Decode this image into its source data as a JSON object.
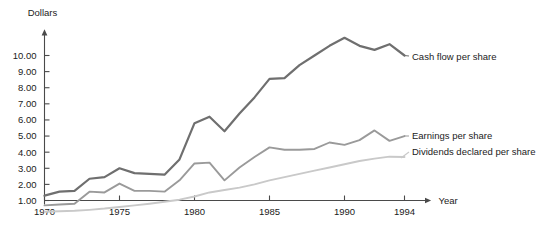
{
  "chart_data": {
    "type": "line",
    "title": "",
    "xlabel": "Year",
    "ylabel": "Dollars",
    "grid": false,
    "legend_position": "inline-right",
    "xlim": [
      1970,
      1994
    ],
    "ylim": [
      0,
      11.5
    ],
    "x_tick_labels": [
      "1970",
      "1975",
      "1980",
      "1985",
      "1990",
      "1994"
    ],
    "x_ticks": [
      1970,
      1975,
      1980,
      1985,
      1990,
      1994
    ],
    "y_tick_labels": [
      "1.00",
      "2.00",
      "3.00",
      "4.00",
      "5.00",
      "6.00",
      "7.00",
      "8.00",
      "9.00",
      "10.00"
    ],
    "y_ticks": [
      1,
      2,
      3,
      4,
      5,
      6,
      7,
      8,
      9,
      10
    ],
    "x": [
      1970,
      1971,
      1972,
      1973,
      1974,
      1975,
      1976,
      1977,
      1978,
      1979,
      1980,
      1981,
      1982,
      1983,
      1984,
      1985,
      1986,
      1987,
      1988,
      1989,
      1990,
      1991,
      1992,
      1993,
      1994
    ],
    "series": [
      {
        "name": "Cash flow per share",
        "color": "#6f6f6f",
        "values": [
          1.3,
          1.55,
          1.6,
          2.35,
          2.45,
          3.0,
          2.7,
          2.65,
          2.6,
          3.55,
          5.8,
          6.2,
          5.3,
          6.4,
          7.4,
          8.55,
          8.6,
          9.4,
          10.0,
          10.6,
          11.1,
          10.6,
          10.35,
          10.7,
          10.0
        ]
      },
      {
        "name": "Earnings per share",
        "color": "#9a9a9a",
        "values": [
          0.7,
          0.75,
          0.8,
          1.55,
          1.5,
          2.05,
          1.6,
          1.6,
          1.55,
          2.25,
          3.3,
          3.35,
          2.25,
          3.05,
          3.7,
          4.3,
          4.15,
          4.15,
          4.2,
          4.6,
          4.45,
          4.75,
          5.35,
          4.7,
          5.0
        ]
      },
      {
        "name": "Dividends declared per share",
        "color": "#c9c9c9",
        "values": [
          0.3,
          0.33,
          0.36,
          0.42,
          0.5,
          0.6,
          0.7,
          0.8,
          0.92,
          1.05,
          1.25,
          1.5,
          1.65,
          1.8,
          2.0,
          2.25,
          2.45,
          2.65,
          2.85,
          3.05,
          3.25,
          3.45,
          3.6,
          3.72,
          3.7
        ]
      }
    ]
  },
  "axes": {
    "y_axis_title": "Dollars",
    "x_axis_title": "Year"
  }
}
